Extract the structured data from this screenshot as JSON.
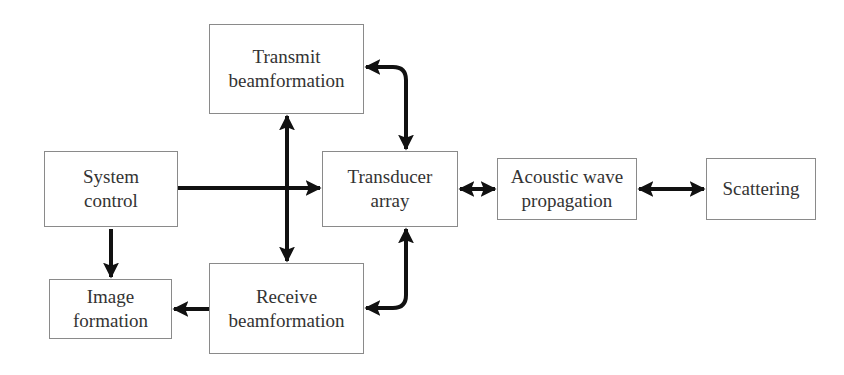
{
  "diagram": {
    "type": "block-diagram",
    "boxes": {
      "transmit": {
        "line1": "Transmit",
        "line2": "beamformation"
      },
      "system": {
        "line1": "System",
        "line2": "control"
      },
      "transducer": {
        "line1": "Transducer",
        "line2": "array"
      },
      "acoustic": {
        "line1": "Acoustic wave",
        "line2": "propagation"
      },
      "scattering": {
        "line1": "Scattering"
      },
      "image": {
        "line1": "Image",
        "line2": "formation"
      },
      "receive": {
        "line1": "Receive",
        "line2": "beamformation"
      }
    },
    "connections": [
      {
        "from": "System control",
        "to": "Transducer array",
        "type": "arrow"
      },
      {
        "from": "Transmit beamformation",
        "to": "Receive beamformation",
        "type": "bidirectional"
      },
      {
        "from": "Transducer array",
        "to": "Transmit beamformation",
        "type": "bidirectional-curved"
      },
      {
        "from": "Transducer array",
        "to": "Receive beamformation",
        "type": "bidirectional-curved"
      },
      {
        "from": "Transducer array",
        "to": "Acoustic wave propagation",
        "type": "bidirectional"
      },
      {
        "from": "Acoustic wave propagation",
        "to": "Scattering",
        "type": "bidirectional"
      },
      {
        "from": "System control",
        "to": "Image formation",
        "type": "arrow"
      },
      {
        "from": "Receive beamformation",
        "to": "Image formation",
        "type": "arrow"
      }
    ]
  }
}
